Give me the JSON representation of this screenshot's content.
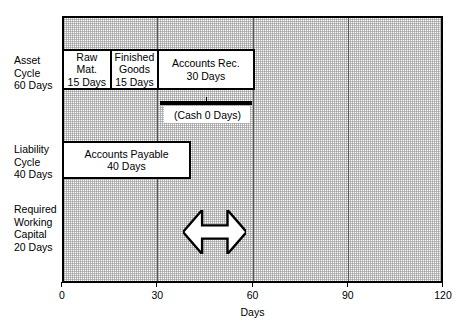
{
  "figure": {
    "type": "gantt-timeline-diagram",
    "axis": {
      "title": "Days",
      "min": 0,
      "max": 120,
      "ticks": [
        {
          "value": 0,
          "label": "0"
        },
        {
          "value": 30,
          "label": "30"
        },
        {
          "value": 60,
          "label": "60"
        },
        {
          "value": 90,
          "label": "90"
        },
        {
          "value": 120,
          "label": "120"
        }
      ],
      "gridlines": [
        30,
        60,
        90
      ]
    },
    "row_labels": [
      {
        "name": "asset-cycle",
        "lines": [
          "Asset",
          "Cycle",
          "60 Days"
        ],
        "top": 54
      },
      {
        "name": "liability-cycle",
        "lines": [
          "Liability",
          "Cycle",
          "40 Days"
        ],
        "top": 143
      },
      {
        "name": "required-working-capital",
        "lines": [
          "Required",
          "Working",
          "Capital",
          "20 Days"
        ],
        "top": 203
      }
    ],
    "bars": [
      {
        "name": "raw-materials",
        "lines": [
          "Raw",
          "Mat.",
          "15 Days"
        ],
        "start_day": 0,
        "end_day": 15,
        "top": 47,
        "height": 41
      },
      {
        "name": "finished-goods",
        "lines": [
          "Finished",
          "Goods",
          "15 Days"
        ],
        "start_day": 15,
        "end_day": 30,
        "top": 47,
        "height": 41
      },
      {
        "name": "accounts-receivable",
        "lines": [
          "Accounts Rec.",
          "30 Days"
        ],
        "start_day": 30,
        "end_day": 60,
        "top": 47,
        "height": 41
      },
      {
        "name": "accounts-payable",
        "lines": [
          "Accounts Payable",
          "40 Days"
        ],
        "start_day": 0,
        "end_day": 40,
        "top": 139,
        "height": 38
      }
    ],
    "cash_callout": {
      "name": "cash-callout",
      "label": "(Cash 0 Days)",
      "start_day": 31,
      "end_day": 60,
      "bar_top": 99,
      "bar_height": 4,
      "label_top": 104,
      "label_height": 17
    },
    "working_capital_arrow": {
      "name": "working-capital-arrow",
      "start_day": 38,
      "end_day": 58,
      "top": 208,
      "height": 44,
      "fill": "#ffffff",
      "stroke": "#000000"
    },
    "colors": {
      "ink": "#000000",
      "plot_background": "#fbfbfb",
      "grid": "#555555",
      "box_fill": "#ffffff"
    }
  }
}
